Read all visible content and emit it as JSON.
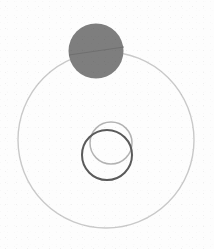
{
  "figure": {
    "title": "",
    "canvas": {
      "width": 214,
      "height": 249,
      "background_color": "#fdfdfd"
    },
    "shapes": [
      {
        "id": "outer-ring",
        "label": "large outer circle outline",
        "kind": "circle-outline",
        "cx": 106,
        "cy": 140,
        "r": 88,
        "stroke_color": "#c9c9c9",
        "stroke_width": 1.4,
        "fill": "none"
      },
      {
        "id": "filled-disc",
        "label": "filled gray disc at top",
        "kind": "circle-filled",
        "cx": 96,
        "cy": 51,
        "r": 27.5,
        "fill_color": "#7e7e7e",
        "stroke_color": "none",
        "stroke_width": 0
      },
      {
        "id": "disc-chord",
        "label": "faint chord line crossing the disc",
        "kind": "chord",
        "x1": 69,
        "y1": 55,
        "x2": 124,
        "y2": 47,
        "stroke_color": "#6b6b6b",
        "stroke_width": 1.2
      },
      {
        "id": "inner-ring-light",
        "label": "light gray inner circle outline",
        "kind": "circle-outline",
        "cx": 111,
        "cy": 143,
        "r": 21,
        "stroke_color": "#b3b3b3",
        "stroke_width": 1.5,
        "fill": "none"
      },
      {
        "id": "inner-ring-dark",
        "label": "dark gray inner circle outline",
        "kind": "circle-outline",
        "cx": 107,
        "cy": 155,
        "r": 25,
        "stroke_color": "#5a5a5a",
        "stroke_width": 2,
        "fill": "none"
      }
    ],
    "palette": {
      "background": "#fdfdfd",
      "outer_ring": "#c9c9c9",
      "disc_fill": "#7e7e7e",
      "inner_light": "#b3b3b3",
      "inner_dark": "#5a5a5a"
    },
    "annotations": [],
    "labels": []
  }
}
